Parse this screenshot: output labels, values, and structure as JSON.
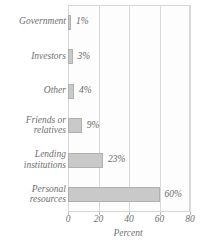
{
  "chart_data": {
    "type": "bar",
    "orientation": "horizontal",
    "title": "",
    "xlabel": "Percent",
    "ylabel": "",
    "xlim": [
      0,
      80
    ],
    "xticks": [
      0,
      20,
      40,
      60,
      80
    ],
    "grid": true,
    "legend": false,
    "categories": [
      "Government",
      "Investors",
      "Other",
      "Friends or relatives",
      "Lending institutions",
      "Personal resources"
    ],
    "values": [
      1,
      3,
      4,
      9,
      23,
      60
    ],
    "data_labels": [
      "1%",
      "3%",
      "4%",
      "9%",
      "23%",
      "60%"
    ],
    "bars": [
      {
        "label_line1": "Government",
        "label_line2": "",
        "value": 1,
        "data_label": "1%"
      },
      {
        "label_line1": "Investors",
        "label_line2": "",
        "value": 3,
        "data_label": "3%"
      },
      {
        "label_line1": "Other",
        "label_line2": "",
        "value": 4,
        "data_label": "4%"
      },
      {
        "label_line1": "Friends or",
        "label_line2": "relatives",
        "value": 9,
        "data_label": "9%"
      },
      {
        "label_line1": "Lending",
        "label_line2": "institutions",
        "value": 23,
        "data_label": "23%"
      },
      {
        "label_line1": "Personal",
        "label_line2": "resources",
        "value": 60,
        "data_label": "60%"
      }
    ],
    "colors": {
      "bar_fill": "#c9c9c9",
      "bar_border": "#b0b0b0",
      "plot_background": "#fdfdfd",
      "gridline": "#d9d9d9",
      "text": "#6f6f6f",
      "frame": "#d7d7d7"
    }
  }
}
